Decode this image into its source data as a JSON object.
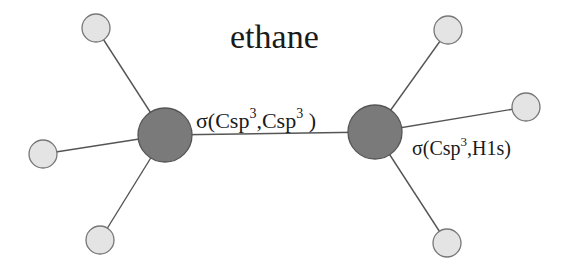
{
  "title": "ethane",
  "labels": {
    "cc_bond": {
      "prefix": "σ(Csp",
      "sup1": "3",
      "mid": ",Csp",
      "sup2": "3",
      "suffix": " )"
    },
    "ch_bond": {
      "prefix": "σ(Csp",
      "sup1": "3",
      "suffix": ",H1s)"
    }
  },
  "colors": {
    "carbon_fill": "#7a7a7a",
    "carbon_stroke": "#555555",
    "hydrogen_fill": "#e4e4e4",
    "hydrogen_stroke": "#777777",
    "bond": "#555555",
    "text": "#1a1a1a"
  },
  "atoms": {
    "carbons": [
      {
        "id": "C1",
        "x": 165,
        "y": 135,
        "r": 27
      },
      {
        "id": "C2",
        "x": 375,
        "y": 132,
        "r": 27
      }
    ],
    "hydrogens": [
      {
        "id": "H1",
        "bonded_to": "C1",
        "x": 96,
        "y": 28,
        "r": 14
      },
      {
        "id": "H2",
        "bonded_to": "C1",
        "x": 43,
        "y": 154,
        "r": 14
      },
      {
        "id": "H3",
        "bonded_to": "C1",
        "x": 100,
        "y": 240,
        "r": 14
      },
      {
        "id": "H4",
        "bonded_to": "C2",
        "x": 448,
        "y": 30,
        "r": 14
      },
      {
        "id": "H5",
        "bonded_to": "C2",
        "x": 526,
        "y": 107,
        "r": 14
      },
      {
        "id": "H6",
        "bonded_to": "C2",
        "x": 447,
        "y": 243,
        "r": 14
      }
    ]
  }
}
